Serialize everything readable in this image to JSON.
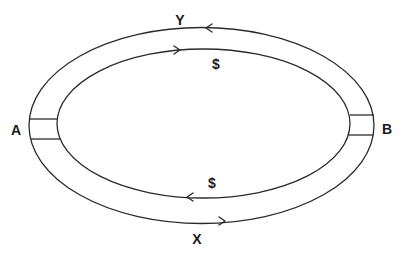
{
  "diagram": {
    "type": "circular-flow",
    "nodes": [
      {
        "id": "A",
        "label": "A",
        "position": "left"
      },
      {
        "id": "B",
        "label": "B",
        "position": "right"
      }
    ],
    "flows": [
      {
        "from": "B",
        "to": "A",
        "path": "outer-top",
        "label": "Y"
      },
      {
        "from": "A",
        "to": "B",
        "path": "inner-top",
        "label": "$"
      },
      {
        "from": "B",
        "to": "A",
        "path": "inner-bottom",
        "label": "$"
      },
      {
        "from": "A",
        "to": "B",
        "path": "outer-bottom",
        "label": "X"
      }
    ]
  },
  "labels": {
    "y": "Y",
    "money_top": "$",
    "a": "A",
    "b": "B",
    "money_bottom": "$",
    "x": "X"
  },
  "colors": {
    "line": "#2a2a2a",
    "background": "#ffffff"
  }
}
